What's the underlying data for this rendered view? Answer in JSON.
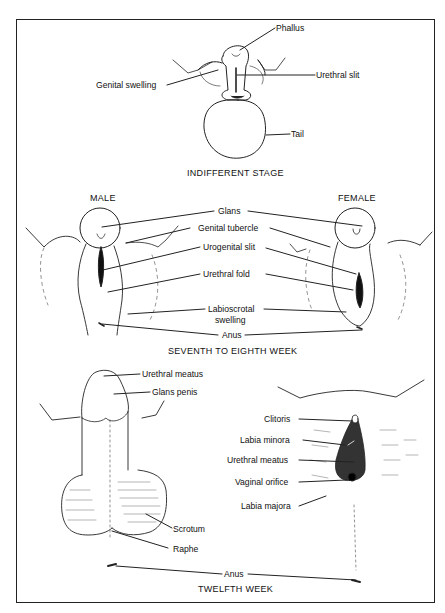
{
  "diagram": {
    "panels": [
      {
        "id": "indifferent",
        "caption": "INDIFFERENT STAGE",
        "labels": {
          "phallus": "Phallus",
          "genital_swelling": "Genital swelling",
          "urethral_slit": "Urethral slit",
          "tail": "Tail"
        }
      },
      {
        "id": "seventh_eighth",
        "caption": "SEVENTH TO EIGHTH WEEK",
        "headings": {
          "male": "MALE",
          "female": "FEMALE"
        },
        "labels": {
          "glans": "Glans",
          "genital_tubercle": "Genital tubercle",
          "urogenital_slit": "Urogenital slit",
          "urethral_fold": "Urethral fold",
          "labioscrotal_1": "Labioscrotal",
          "labioscrotal_2": "swelling",
          "anus": "Anus"
        }
      },
      {
        "id": "twelfth",
        "caption": "TWELFTH WEEK",
        "male_labels": {
          "urethral_meatus": "Urethral meatus",
          "glans_penis": "Glans penis",
          "scrotum": "Scrotum",
          "raphe": "Raphe"
        },
        "female_labels": {
          "clitoris": "Clitoris",
          "labia_minora": "Labia minora",
          "urethral_meatus": "Urethral meatus",
          "vaginal_orifice": "Vaginal orifice",
          "labia_majora": "Labia majora"
        },
        "shared_labels": {
          "anus": "Anus"
        }
      }
    ]
  }
}
